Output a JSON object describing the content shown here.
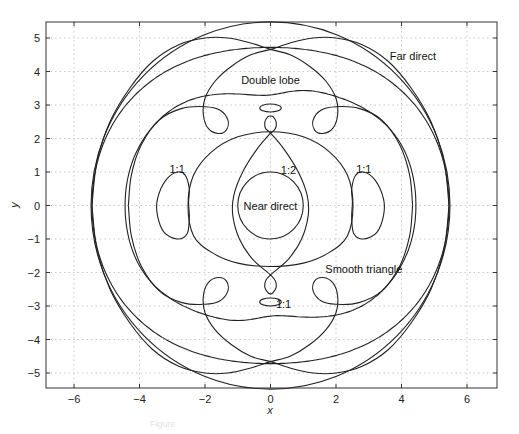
{
  "chart_data": {
    "type": "line",
    "title": "",
    "xlabel": "x",
    "ylabel": "y",
    "xlim": [
      -6.9,
      6.9
    ],
    "ylim": [
      -5.5,
      5.5
    ],
    "grid": true,
    "legend": null,
    "xticks": [
      -6,
      -4,
      -2,
      0,
      2,
      4,
      6
    ],
    "yticks": [
      -5,
      -4,
      -3,
      -2,
      -1,
      0,
      1,
      2,
      3,
      4,
      5
    ],
    "xtick_labels": [
      "−6",
      "−4",
      "−2",
      "0",
      "2",
      "4",
      "6"
    ],
    "ytick_labels": [
      "−5",
      "−4",
      "−3",
      "−2",
      "−1",
      "0",
      "1",
      "2",
      "3",
      "4",
      "5"
    ],
    "annotations": [
      {
        "text": "Far direct",
        "x": 4.35,
        "y": 4.45
      },
      {
        "text": "Double lobe",
        "x": 0.0,
        "y": 3.75
      },
      {
        "text": "1:2",
        "x": 0.55,
        "y": 1.05
      },
      {
        "text": "1:1",
        "x": -2.85,
        "y": 1.1
      },
      {
        "text": "1:1",
        "x": 2.85,
        "y": 1.1
      },
      {
        "text": "Near direct",
        "x": 0.0,
        "y": 0.0
      },
      {
        "text": "Smooth triangle",
        "x": 2.85,
        "y": -1.9
      },
      {
        "text": "1:1",
        "x": 0.4,
        "y": -2.95
      }
    ],
    "series": [
      {
        "name": "Near direct",
        "kind": "circle",
        "cx": 0,
        "cy": 0,
        "r": 1.0
      },
      {
        "name": "Far direct (outer)",
        "kind": "circle",
        "cx": 0,
        "cy": 0,
        "r": 5.48
      },
      {
        "name": "Far direct (inner)",
        "kind": "polar",
        "r_side": 5.45,
        "r_pole": 4.72
      },
      {
        "name": "Double lobe (wavy ring)",
        "kind": "polar_wavy",
        "r_side": 4.44,
        "r_pole": 3.42,
        "dip": 0.12
      },
      {
        "name": "Double lobe (arches with loops)",
        "kind": "points",
        "closed": false,
        "points": [
          [
            -4.34,
            0
          ],
          [
            -4.25,
            -0.9
          ],
          [
            -3.95,
            -1.8
          ],
          [
            -3.4,
            -2.55
          ],
          [
            -2.7,
            -2.9
          ],
          [
            -2.0,
            -2.95
          ],
          [
            -1.55,
            -2.85
          ],
          [
            -1.3,
            -2.55
          ],
          [
            -1.35,
            -2.25
          ],
          [
            -1.6,
            -2.15
          ],
          [
            -1.9,
            -2.3
          ],
          [
            -2.05,
            -2.7
          ],
          [
            -2.0,
            -3.2
          ],
          [
            -1.7,
            -3.7
          ],
          [
            -1.2,
            -4.15
          ],
          [
            -0.6,
            -4.5
          ],
          [
            0,
            -4.66
          ],
          [
            0.6,
            -4.85
          ],
          [
            1.3,
            -5.0
          ],
          [
            2.0,
            -5.0
          ],
          [
            2.8,
            -4.8
          ],
          [
            3.6,
            -4.3
          ],
          [
            4.3,
            -3.5
          ],
          [
            4.9,
            -2.5
          ],
          [
            5.3,
            -1.3
          ],
          [
            5.45,
            0
          ]
        ]
      },
      {
        "name": "Double lobe (arches with loops, mirrored)",
        "kind": "points",
        "closed": false,
        "points": [
          [
            4.34,
            0
          ],
          [
            4.25,
            -0.9
          ],
          [
            3.95,
            -1.8
          ],
          [
            3.4,
            -2.55
          ],
          [
            2.7,
            -2.9
          ],
          [
            2.0,
            -2.95
          ],
          [
            1.55,
            -2.85
          ],
          [
            1.3,
            -2.55
          ],
          [
            1.35,
            -2.25
          ],
          [
            1.6,
            -2.15
          ],
          [
            1.9,
            -2.3
          ],
          [
            2.05,
            -2.7
          ],
          [
            2.0,
            -3.2
          ],
          [
            1.7,
            -3.7
          ],
          [
            1.2,
            -4.15
          ],
          [
            0.6,
            -4.5
          ],
          [
            0,
            -4.66
          ],
          [
            -0.6,
            -4.85
          ],
          [
            -1.3,
            -5.0
          ],
          [
            -2.0,
            -5.0
          ],
          [
            -2.8,
            -4.8
          ],
          [
            -3.6,
            -4.3
          ],
          [
            -4.3,
            -3.5
          ],
          [
            -4.9,
            -2.5
          ],
          [
            -5.3,
            -1.3
          ],
          [
            -5.45,
            0
          ]
        ]
      },
      {
        "name": "Double lobe (upper arches with loops)",
        "kind": "points",
        "closed": false,
        "points": [
          [
            -4.34,
            0
          ],
          [
            -4.25,
            0.9
          ],
          [
            -3.95,
            1.8
          ],
          [
            -3.4,
            2.55
          ],
          [
            -2.7,
            2.9
          ],
          [
            -2.0,
            2.95
          ],
          [
            -1.55,
            2.85
          ],
          [
            -1.3,
            2.55
          ],
          [
            -1.35,
            2.25
          ],
          [
            -1.6,
            2.15
          ],
          [
            -1.9,
            2.3
          ],
          [
            -2.05,
            2.7
          ],
          [
            -2.0,
            3.2
          ],
          [
            -1.7,
            3.7
          ],
          [
            -1.2,
            4.15
          ],
          [
            -0.6,
            4.5
          ],
          [
            0,
            4.66
          ],
          [
            0.6,
            4.85
          ],
          [
            1.3,
            5.0
          ],
          [
            2.0,
            5.0
          ],
          [
            2.8,
            4.8
          ],
          [
            3.6,
            4.3
          ],
          [
            4.3,
            3.5
          ],
          [
            4.9,
            2.5
          ],
          [
            5.3,
            1.3
          ],
          [
            5.45,
            0
          ]
        ]
      },
      {
        "name": "Double lobe (upper arches mirrored)",
        "kind": "points",
        "closed": false,
        "points": [
          [
            4.34,
            0
          ],
          [
            4.25,
            0.9
          ],
          [
            3.95,
            1.8
          ],
          [
            3.4,
            2.55
          ],
          [
            2.7,
            2.9
          ],
          [
            2.0,
            2.95
          ],
          [
            1.55,
            2.85
          ],
          [
            1.3,
            2.55
          ],
          [
            1.35,
            2.25
          ],
          [
            1.6,
            2.15
          ],
          [
            1.9,
            2.3
          ],
          [
            2.05,
            2.7
          ],
          [
            2.0,
            3.2
          ],
          [
            1.7,
            3.7
          ],
          [
            1.2,
            4.15
          ],
          [
            0.6,
            4.5
          ],
          [
            0,
            4.66
          ],
          [
            -0.6,
            4.85
          ],
          [
            -1.3,
            5.0
          ],
          [
            -2.0,
            5.0
          ],
          [
            -2.8,
            4.8
          ],
          [
            -3.6,
            4.3
          ],
          [
            -4.3,
            3.5
          ],
          [
            -4.9,
            2.5
          ],
          [
            -5.3,
            1.3
          ],
          [
            -5.45,
            0
          ]
        ]
      },
      {
        "name": "Smooth triangle",
        "kind": "points",
        "closed": true,
        "points": [
          [
            0,
            2.2
          ],
          [
            1.0,
            2.05
          ],
          [
            1.8,
            1.6
          ],
          [
            2.35,
            0.9
          ],
          [
            2.52,
            0
          ],
          [
            2.35,
            -0.9
          ],
          [
            1.8,
            -1.4
          ],
          [
            1.0,
            -1.72
          ],
          [
            0,
            -1.82
          ],
          [
            -1.0,
            -1.72
          ],
          [
            -1.8,
            -1.4
          ],
          [
            -2.35,
            -0.9
          ],
          [
            -2.52,
            0
          ],
          [
            -2.35,
            0.9
          ],
          [
            -1.8,
            1.6
          ],
          [
            -1.0,
            2.05
          ]
        ]
      },
      {
        "name": "1:2 lens",
        "kind": "points",
        "closed": false,
        "points": [
          [
            0,
            2.16
          ],
          [
            0.15,
            2.3
          ],
          [
            0.17,
            2.5
          ],
          [
            0.08,
            2.65
          ],
          [
            0,
            2.67
          ],
          [
            -0.08,
            2.65
          ],
          [
            -0.17,
            2.5
          ],
          [
            -0.15,
            2.3
          ],
          [
            0,
            2.16
          ],
          [
            0.4,
            1.7
          ],
          [
            0.85,
            1.0
          ],
          [
            1.12,
            0.3
          ],
          [
            1.15,
            -0.3
          ],
          [
            0.95,
            -1.0
          ],
          [
            0.55,
            -1.6
          ],
          [
            0,
            -2.07
          ],
          [
            -0.15,
            -2.25
          ],
          [
            -0.17,
            -2.45
          ],
          [
            -0.08,
            -2.6
          ],
          [
            0,
            -2.64
          ],
          [
            0.08,
            -2.6
          ],
          [
            0.17,
            -2.45
          ],
          [
            0.15,
            -2.25
          ],
          [
            0,
            -2.07
          ],
          [
            -0.55,
            -1.6
          ],
          [
            -0.95,
            -1.0
          ],
          [
            -1.15,
            -0.3
          ],
          [
            -1.12,
            0.3
          ],
          [
            -0.85,
            1.0
          ],
          [
            -0.4,
            1.7
          ],
          [
            0,
            2.16
          ]
        ]
      },
      {
        "name": "1:1 (top)",
        "kind": "ellipse",
        "cx": 0,
        "cy": 2.91,
        "rx": 0.33,
        "ry": 0.12
      },
      {
        "name": "1:1 (bottom)",
        "kind": "ellipse",
        "cx": 0,
        "cy": -2.88,
        "rx": 0.33,
        "ry": 0.12
      },
      {
        "name": "1:1 (left)",
        "kind": "points",
        "closed": true,
        "points": [
          [
            -2.85,
            1.0
          ],
          [
            -3.2,
            0.75
          ],
          [
            -3.45,
            0.2
          ],
          [
            -3.45,
            -0.3
          ],
          [
            -3.25,
            -0.8
          ],
          [
            -2.85,
            -1.0
          ],
          [
            -2.55,
            -0.85
          ],
          [
            -2.48,
            -0.4
          ],
          [
            -2.5,
            0.1
          ],
          [
            -2.48,
            0.5
          ],
          [
            -2.6,
            0.9
          ]
        ]
      },
      {
        "name": "1:1 (right)",
        "kind": "points",
        "closed": true,
        "points": [
          [
            2.85,
            1.0
          ],
          [
            3.2,
            0.75
          ],
          [
            3.45,
            0.2
          ],
          [
            3.45,
            -0.3
          ],
          [
            3.25,
            -0.8
          ],
          [
            2.85,
            -1.0
          ],
          [
            2.55,
            -0.85
          ],
          [
            2.48,
            -0.4
          ],
          [
            2.5,
            0.1
          ],
          [
            2.48,
            0.5
          ],
          [
            2.6,
            0.9
          ]
        ]
      }
    ]
  },
  "caption": "Figure"
}
